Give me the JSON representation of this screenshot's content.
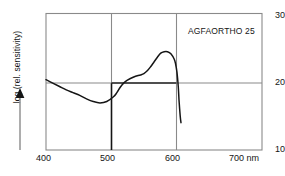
{
  "chart_data": {
    "type": "line",
    "title": "",
    "annotation": "AGFAORTHO 25",
    "xlabel": "nm",
    "ylabel": "log (rel. sensitivity)",
    "xlim": [
      400,
      720
    ],
    "ylim": [
      10,
      30
    ],
    "xticks": [
      400,
      500,
      600,
      700
    ],
    "xtick_labels": [
      "400",
      "500",
      "600",
      "700 nm"
    ],
    "yticks": [
      10,
      20,
      30
    ],
    "ytick_labels": [
      "10",
      "20",
      "30"
    ],
    "grid": {
      "vertical_at": [
        500,
        600
      ],
      "horizontal_at": [
        20
      ],
      "emphasis_note": "500 nm line dark below y=20; y=20 line dark between 500 and 600 nm"
    },
    "legend_position": "top-right",
    "series": [
      {
        "name": "AGFAORTHO 25",
        "color": "#151515",
        "x": [
          400,
          410,
          420,
          430,
          440,
          450,
          460,
          470,
          480,
          490,
          500,
          505,
          510,
          515,
          520,
          530,
          540,
          545,
          550,
          555,
          560,
          565,
          570,
          575,
          580,
          585,
          590,
          592,
          594,
          596,
          597,
          598,
          599,
          600
        ],
        "y": [
          20.3,
          19.8,
          19.3,
          18.8,
          18.4,
          18.0,
          17.5,
          17.1,
          16.9,
          17.1,
          17.8,
          18.4,
          19.2,
          19.8,
          20.2,
          20.7,
          21.0,
          21.2,
          21.6,
          22.2,
          22.9,
          23.6,
          24.2,
          24.4,
          24.4,
          24.1,
          23.3,
          22.6,
          21.4,
          19.2,
          17.4,
          16.0,
          14.8,
          14.0
        ]
      }
    ]
  },
  "axes": {
    "y_axis_title": "log (rel. sensitivity)",
    "y_tick_30": "30",
    "y_tick_20": "20",
    "y_tick_10": "10",
    "x_tick_400": "400",
    "x_tick_500": "500",
    "x_tick_600": "600",
    "x_tick_700": "700 nm"
  },
  "colors": {
    "curve": "#151515",
    "frame": "#8a8a8a",
    "grid_light": "#8a8a8a",
    "grid_dark": "#151515",
    "text": "#151515",
    "background": "#ffffff"
  }
}
